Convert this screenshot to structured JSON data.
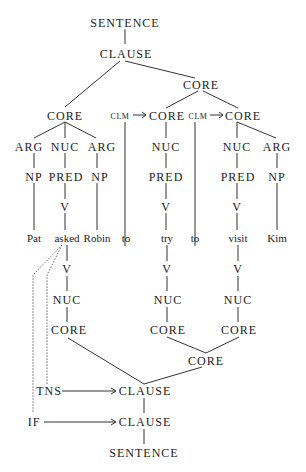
{
  "diagram": {
    "type": "syntax-tree",
    "nodes": {
      "sentence_top": "SENTENCE",
      "clause_top": "CLAUSE",
      "core_right": "CORE",
      "core_left": "CORE",
      "clm1": "CLM",
      "core_mid1": "CORE",
      "clm2": "CLM",
      "core_mid2": "CORE",
      "arg1": "ARG",
      "nuc1": "NUC",
      "arg2": "ARG",
      "nuc2": "NUC",
      "nuc3": "NUC",
      "arg3": "ARG",
      "np1": "NP",
      "pred1": "PRED",
      "np2": "NP",
      "pred2": "PRED",
      "pred3": "PRED",
      "np3": "NP",
      "v1": "V",
      "v2": "V",
      "v3": "V",
      "v1b": "V",
      "v2b": "V",
      "v3b": "V",
      "nuc1b": "NUC",
      "nuc2b": "NUC",
      "nuc3b": "NUC",
      "core1b": "CORE",
      "core2b": "CORE",
      "core3b": "CORE",
      "core_merge": "CORE",
      "tns": "TNS",
      "clause_tns": "CLAUSE",
      "if": "IF",
      "clause_if": "CLAUSE",
      "sentence_bottom": "SENTENCE"
    },
    "words": [
      "Pat",
      "asked",
      "Robin",
      "to",
      "try",
      "to",
      "visit",
      "Kim"
    ]
  }
}
